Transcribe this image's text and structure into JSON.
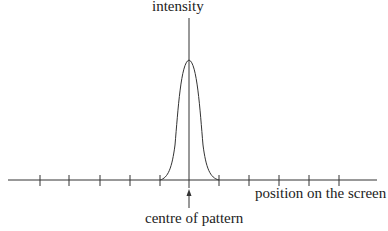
{
  "labels": {
    "y_axis": "intensity",
    "x_axis": "position on the screen",
    "centre": "centre of pattern"
  },
  "diagram": {
    "type": "single-slit intensity profile",
    "axis_color": "#333333",
    "curve_color": "#333333",
    "tick_count": 11,
    "centre_marker": "arrow-up"
  }
}
